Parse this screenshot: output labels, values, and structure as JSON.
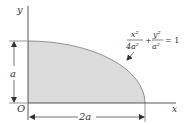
{
  "figure": {
    "type": "quarter-ellipse area diagram",
    "axes": {
      "x_label": "x",
      "y_label": "y",
      "origin_label": "O"
    },
    "dimensions": {
      "height_label": "a",
      "width_label": "2a"
    },
    "equation": {
      "term1_num": "x²",
      "term1_den": "4a²",
      "plus": "+",
      "term2_num": "y²",
      "term2_den": "a²",
      "equals": "= 1"
    },
    "colors": {
      "fill": "#dcdcdc",
      "line": "#555555",
      "axis": "#444444"
    }
  }
}
